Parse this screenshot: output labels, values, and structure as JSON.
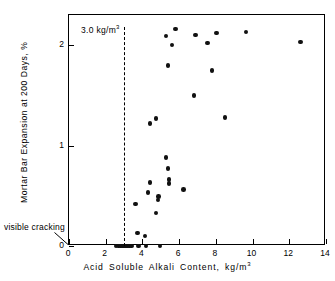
{
  "chart_data": {
    "type": "scatter",
    "title": "",
    "xlabel": "Acid  Soluble  Alkali  Content,  kg/m3",
    "xlabel_base": "Acid  Soluble  Alkali  Content,  kg/m",
    "xlabel_sup": "3",
    "ylabel": "Mortar Bar Expansion at 200 Days, %",
    "xlim": [
      0,
      14
    ],
    "ylim": [
      0,
      2.3
    ],
    "xticks": [
      0,
      2,
      4,
      6,
      8,
      10,
      12,
      14
    ],
    "xtick_labels": [
      "0",
      "2",
      "4",
      "6",
      "8",
      "10",
      "12",
      "14"
    ],
    "yticks": [
      0,
      1,
      2
    ],
    "ytick_labels": [
      "0",
      "1",
      "2"
    ],
    "grid": false,
    "legend": false,
    "marker": "filled-circle",
    "marker_color": "#111111",
    "annotations": [
      {
        "name": "threshold",
        "text_base": "3.0  kg/m",
        "text_sup": "3",
        "text": "3.0  kg/m3",
        "x": 3.0,
        "style": "vertical-dashed-line"
      },
      {
        "name": "visible-cracking",
        "text": "visible cracking",
        "points_to_x": 0.0,
        "points_to_y": 0.0,
        "style": "leader-line"
      }
    ],
    "points": [
      {
        "x": 2.55,
        "y": 0.0
      },
      {
        "x": 2.7,
        "y": 0.0
      },
      {
        "x": 2.8,
        "y": 0.0
      },
      {
        "x": 2.88,
        "y": 0.0
      },
      {
        "x": 2.95,
        "y": 0.0
      },
      {
        "x": 3.0,
        "y": 0.0
      },
      {
        "x": 3.05,
        "y": 0.0
      },
      {
        "x": 3.1,
        "y": 0.0
      },
      {
        "x": 3.16,
        "y": 0.0
      },
      {
        "x": 3.22,
        "y": 0.0
      },
      {
        "x": 3.3,
        "y": 0.0
      },
      {
        "x": 3.42,
        "y": 0.0
      },
      {
        "x": 3.8,
        "y": 0.0
      },
      {
        "x": 4.2,
        "y": 0.0
      },
      {
        "x": 4.95,
        "y": 0.0
      },
      {
        "x": 3.72,
        "y": 0.13
      },
      {
        "x": 4.15,
        "y": 0.1
      },
      {
        "x": 3.62,
        "y": 0.42
      },
      {
        "x": 4.3,
        "y": 0.53
      },
      {
        "x": 4.75,
        "y": 0.33
      },
      {
        "x": 4.85,
        "y": 0.46
      },
      {
        "x": 4.88,
        "y": 0.49
      },
      {
        "x": 4.42,
        "y": 0.63
      },
      {
        "x": 5.45,
        "y": 0.62
      },
      {
        "x": 5.45,
        "y": 0.66
      },
      {
        "x": 5.4,
        "y": 0.77
      },
      {
        "x": 5.28,
        "y": 0.88
      },
      {
        "x": 6.25,
        "y": 0.56
      },
      {
        "x": 4.42,
        "y": 1.22
      },
      {
        "x": 4.75,
        "y": 1.27
      },
      {
        "x": 8.5,
        "y": 1.28
      },
      {
        "x": 6.8,
        "y": 1.5
      },
      {
        "x": 7.8,
        "y": 1.75
      },
      {
        "x": 5.4,
        "y": 1.8
      },
      {
        "x": 5.28,
        "y": 2.09
      },
      {
        "x": 5.62,
        "y": 2.0
      },
      {
        "x": 5.8,
        "y": 2.16
      },
      {
        "x": 6.9,
        "y": 2.1
      },
      {
        "x": 7.55,
        "y": 2.02
      },
      {
        "x": 8.05,
        "y": 2.12
      },
      {
        "x": 9.65,
        "y": 2.13
      },
      {
        "x": 12.6,
        "y": 2.03
      }
    ]
  }
}
